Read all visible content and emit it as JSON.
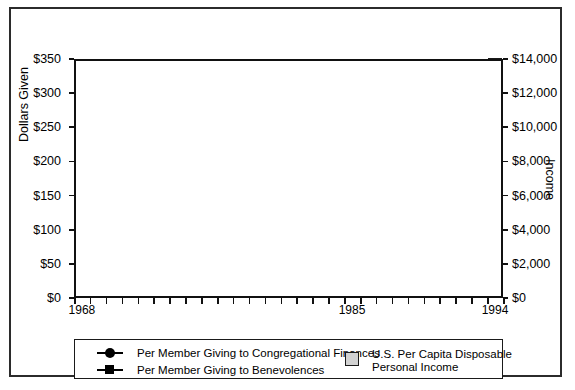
{
  "chart_data": {
    "type": "bar",
    "title": "",
    "xlabel": "",
    "ylabel": "Dollars Given",
    "y2label": "Income",
    "ylim": [
      0,
      350
    ],
    "y2lim": [
      0,
      14000
    ],
    "grid": true,
    "legend_position": "bottom",
    "categories": [
      1968,
      1969,
      1970,
      1971,
      1972,
      1973,
      1974,
      1975,
      1976,
      1977,
      1978,
      1979,
      1980,
      1981,
      1982,
      1983,
      1984,
      1985,
      1986,
      1987,
      1988,
      1989,
      1990,
      1991,
      1992,
      1993,
      1994
    ],
    "x_tick_labels": [
      "1968",
      "1985",
      "1994"
    ],
    "y_tick_labels": [
      "$0",
      "$50",
      "$100",
      "$150",
      "$200",
      "$250",
      "$300",
      "$350"
    ],
    "y_tick_values": [
      0,
      50,
      100,
      150,
      200,
      250,
      300,
      350
    ],
    "y2_tick_labels": [
      "$0",
      "$2,000",
      "$4,000",
      "$6,000",
      "$8,000",
      "$10,000",
      "$12,000",
      "$14,000"
    ],
    "y2_tick_values": [
      0,
      2000,
      4000,
      6000,
      8000,
      10000,
      12000,
      14000
    ],
    "series": [
      {
        "name": "U.S. Per Capita Disposable Personal Income",
        "type": "bar",
        "axis": "right",
        "color": "#d2d2d2",
        "values": [
          9240,
          9320,
          9360,
          9520,
          9840,
          10160,
          9960,
          10000,
          10280,
          10480,
          10840,
          10960,
          10920,
          11080,
          11000,
          11280,
          11960,
          12160,
          12440,
          12600,
          13000,
          13160,
          13200,
          13120,
          13480,
          13520,
          14080
        ]
      },
      {
        "name": "Per Member Giving to Congregational Finances",
        "type": "line",
        "marker": "circle",
        "axis": "left",
        "color": "#000000",
        "values": [
          248,
          240,
          237,
          237,
          241,
          246,
          250,
          249,
          248,
          252,
          256,
          255,
          249,
          254,
          259,
          264,
          269,
          277,
          282,
          288,
          296,
          300,
          303,
          303,
          302,
          302,
          311
        ]
      },
      {
        "name": "Per Member Giving to Benevolences",
        "type": "line",
        "marker": "square",
        "axis": "left",
        "color": "#000000",
        "values": [
          65,
          65,
          62,
          61,
          63,
          63,
          64,
          65,
          65,
          65,
          65,
          65,
          65,
          65,
          65,
          66,
          65,
          65,
          64,
          65,
          65,
          65,
          65,
          64,
          63,
          62,
          62
        ]
      }
    ]
  },
  "legend": {
    "entries": [
      {
        "label": "Per Member Giving to Congregational Finances",
        "marker": "circle-line-marker"
      },
      {
        "label": "Per Member Giving to Benevolences",
        "marker": "square-line-marker"
      },
      {
        "label_line1": "U.S. Per Capita Disposable",
        "label_line2": "Personal Income",
        "marker": "gray-swatch"
      }
    ]
  }
}
